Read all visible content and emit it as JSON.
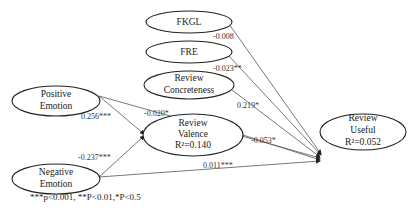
{
  "nodes": {
    "fkgl": {
      "line1": "FKGL"
    },
    "fre": {
      "line1": "FRE"
    },
    "concreteness": {
      "line1": "Review",
      "line2": "Concreteness"
    },
    "positive": {
      "line1": "Positive",
      "line2": "Emotion"
    },
    "negative": {
      "line1": "Negative",
      "line2": "Emotion"
    },
    "valence": {
      "line1": "Review",
      "line2": "Valence",
      "line3": "R²=0.140"
    },
    "useful": {
      "line1": "Review",
      "line2": "Useful",
      "line3": "R²=0.052"
    }
  },
  "paths": {
    "fkgl_useful": "-0.008",
    "fre_useful": "-0.023**",
    "concreteness_useful": "0.219*",
    "positive_useful": "-0.020*",
    "positive_valence": "0.256***",
    "negative_valence": "-0.237***",
    "valence_useful": "-0.053*",
    "negative_useful": "0.011***"
  },
  "note": "***p<0.001, **P<0.01,*P<0.5"
}
